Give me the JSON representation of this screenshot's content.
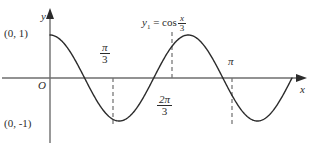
{
  "figure": {
    "kind": "math-function-graph",
    "background_color": "#ffffff",
    "curve_color": "#2b2b2b",
    "axis_color": "#6e6e6e",
    "dash_color": "#6e6e6e",
    "text_color": "#2b2b2b"
  },
  "axes": {
    "y_axis_label": "y",
    "x_axis_label": "x",
    "origin_label": "O"
  },
  "point_labels": {
    "y_intercept_max": "(0, 1)",
    "y_value_min": "(0, -1)"
  },
  "equation": {
    "lhs": "y",
    "lhs_subscript": "1",
    "equals": "=",
    "function": "cos",
    "argument_numerator": "x",
    "argument_denominator": "3",
    "plain_text": "y₁ = cos x/3"
  },
  "tick_labels": [
    {
      "name": "pi-over-3",
      "numerator": "π",
      "denominator": "3",
      "plain_text": "π/3",
      "position": "above-axis"
    },
    {
      "name": "two-pi-over-3",
      "numerator": "2π",
      "denominator": "3",
      "plain_text": "2π/3",
      "position": "below-axis"
    },
    {
      "name": "pi",
      "numerator": "π",
      "denominator": "",
      "plain_text": "π",
      "position": "above-axis"
    }
  ],
  "chart_data": {
    "type": "line",
    "title": "",
    "subtitle": "",
    "xlabel": "x",
    "ylabel": "y",
    "legend": [
      "y₁ = cos x/3"
    ],
    "legend_position": "inline-above-curve",
    "grid": false,
    "xlim": [
      0,
      3.6652
    ],
    "ylim": [
      -1,
      1
    ],
    "x_ticks": [
      1.0472,
      2.0944,
      3.1416
    ],
    "x_tick_labels": [
      "π/3",
      "2π/3",
      "π"
    ],
    "y_ticks": [
      -1,
      1
    ],
    "y_tick_labels": [
      "(0, -1)",
      "(0, 1)"
    ],
    "annotations": [
      {
        "text": "(0, 1)",
        "x": 0,
        "y": 1
      },
      {
        "text": "(0, -1)",
        "x": 0,
        "y": -1
      },
      {
        "text": "π/3",
        "x": 1.0472,
        "y": -1
      },
      {
        "text": "2π/3",
        "x": 2.0944,
        "y": 1
      },
      {
        "text": "π",
        "x": 3.1416,
        "y": -1
      }
    ],
    "dashed_verticals": [
      {
        "x": 1.0472,
        "from_y": 0,
        "to_y": -1
      },
      {
        "x": 2.0944,
        "from_y": 0,
        "to_y": 1
      },
      {
        "x": 3.1416,
        "from_y": 0,
        "to_y": -1
      }
    ],
    "series": [
      {
        "name": "y₁ = cos x/3",
        "drawn_relation": "y = cos(3x)",
        "period": 2.0944,
        "amplitude": 1,
        "x": [
          0,
          0.2618,
          0.5236,
          0.7854,
          1.0472,
          1.309,
          1.5708,
          1.8326,
          2.0944,
          2.3562,
          2.618,
          2.8798,
          3.1416,
          3.4034,
          3.6652
        ],
        "values": [
          1,
          0.7071,
          0,
          -0.7071,
          -1,
          -0.7071,
          0,
          0.7071,
          1,
          0.7071,
          0,
          -0.7071,
          -1,
          -0.7071,
          0
        ]
      }
    ]
  }
}
